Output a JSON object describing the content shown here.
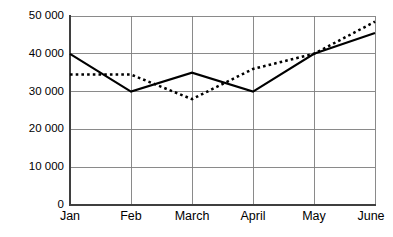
{
  "chart_data": {
    "type": "line",
    "title": "",
    "subtitle": "",
    "xlabel": "",
    "ylabel": "",
    "categories": [
      "Jan",
      "Feb",
      "March",
      "April",
      "May",
      "June"
    ],
    "series": [
      {
        "name": "solid-line",
        "style": "solid",
        "color": "#000000",
        "values": [
          40000,
          30000,
          35000,
          30000,
          40000,
          45500
        ]
      },
      {
        "name": "dotted-line",
        "style": "dotted",
        "color": "#000000",
        "values": [
          34500,
          34500,
          28000,
          36000,
          40000,
          48500
        ]
      }
    ],
    "ylim": [
      0,
      50000
    ],
    "yticks": [
      0,
      10000,
      20000,
      30000,
      40000,
      50000
    ],
    "ytick_labels": [
      "0",
      "10 000",
      "20 000",
      "30 000",
      "40 000",
      "50 000"
    ],
    "xtick_labels": [
      "Jan",
      "Feb",
      "March",
      "April",
      "May",
      "June"
    ],
    "grid": true,
    "grid_axis": "both",
    "legend": false,
    "legend_position": "none",
    "annotations": []
  },
  "axes": {
    "y_axis_name": "y-axis",
    "x_axis_name": "x-axis"
  }
}
